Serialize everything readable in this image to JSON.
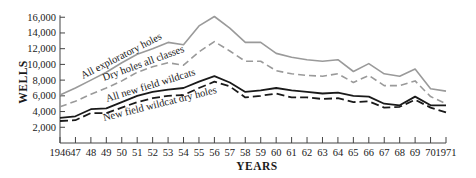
{
  "chart_data": {
    "type": "line",
    "title": "",
    "xlabel": "YEARS",
    "ylabel": "WELLS",
    "ylim": [
      0,
      16000
    ],
    "xlim": [
      1946,
      1971
    ],
    "grid": false,
    "legend_position": "inline labels along lines",
    "x": [
      1946,
      1947,
      1948,
      1949,
      1950,
      1951,
      1952,
      1953,
      1954,
      1955,
      1956,
      1957,
      1958,
      1959,
      1960,
      1961,
      1962,
      1963,
      1964,
      1965,
      1966,
      1967,
      1968,
      1969,
      1970,
      1971
    ],
    "x_tick_labels": [
      "1946",
      "47",
      "48",
      "49",
      "50",
      "51",
      "52",
      "53",
      "54",
      "55",
      "56",
      "57",
      "58",
      "59",
      "60",
      "61",
      "62",
      "63",
      "64",
      "65",
      "66",
      "67",
      "68",
      "69",
      "70",
      "1971"
    ],
    "y_ticks": [
      2000,
      4000,
      6000,
      8000,
      10000,
      12000,
      14000,
      16000
    ],
    "y_tick_labels": [
      "2,000",
      "4,000",
      "6,000",
      "8,000",
      "10,000",
      "12,000",
      "14,000",
      "16,000"
    ],
    "series": [
      {
        "name": "All exploratory holes",
        "style": "solid-gray",
        "color": "#9a9a9a",
        "values": [
          6100,
          7000,
          8000,
          9000,
          10200,
          11300,
          12000,
          12800,
          12500,
          14900,
          16100,
          14600,
          12800,
          12800,
          11400,
          10900,
          10600,
          10400,
          10600,
          9100,
          10100,
          8800,
          8500,
          9400,
          6900,
          6600
        ]
      },
      {
        "name": "Dry holes all classes",
        "style": "dashed-gray",
        "color": "#9a9a9a",
        "values": [
          4600,
          5300,
          6200,
          7000,
          7900,
          9000,
          9700,
          10200,
          9900,
          11600,
          12900,
          11700,
          10400,
          10400,
          9200,
          8800,
          8600,
          8500,
          8800,
          7700,
          8600,
          7300,
          7300,
          7900,
          5900,
          5000
        ]
      },
      {
        "name": "All new field wildcats",
        "style": "solid-black",
        "color": "#1a1a1a",
        "values": [
          3200,
          3400,
          4300,
          4400,
          5200,
          6000,
          6500,
          6800,
          7000,
          7800,
          8500,
          7700,
          6500,
          6700,
          7000,
          6700,
          6500,
          6300,
          6400,
          6000,
          5900,
          5000,
          4800,
          5900,
          4800,
          4800
        ]
      },
      {
        "name": "New field wildcat dry holes",
        "style": "dashed-black",
        "color": "#1a1a1a",
        "values": [
          2800,
          2900,
          3800,
          3800,
          4500,
          5200,
          5700,
          6000,
          6100,
          7000,
          7800,
          7200,
          5800,
          6000,
          6300,
          5800,
          5800,
          5600,
          5700,
          5200,
          5300,
          4500,
          4600,
          5500,
          4500,
          3900
        ]
      }
    ],
    "annotations": [
      {
        "text": "All exploratory holes",
        "series": 0
      },
      {
        "text": "Dry holes all classes",
        "series": 1
      },
      {
        "text": "All new field wildcats",
        "series": 2
      },
      {
        "text": "New field wildcat dry holes",
        "series": 3
      }
    ]
  },
  "labels": {
    "x_axis_title": "YEARS",
    "y_axis_title": "WELLS",
    "series_0": "All exploratory holes",
    "series_1": "Dry holes all classes",
    "series_2": "All new field wildcats",
    "series_3": "New field wildcat dry holes"
  }
}
